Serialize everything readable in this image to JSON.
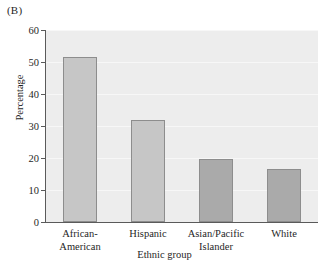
{
  "figure": {
    "panel_label": "(B)",
    "background_color": "#ffffff",
    "plot_background_color": "#ededed",
    "gridline_color": "#f7f7f7",
    "axis_color": "#5a5a5a",
    "text_color": "#1f1f1f"
  },
  "chart_data": {
    "type": "bar",
    "title": "",
    "subtitle": "",
    "panel_label": "(B)",
    "categories": [
      "African-\nAmerican",
      "Hispanic",
      "Asian/Pacific\nIslander",
      "White"
    ],
    "categories_flat": [
      "African-American",
      "Hispanic",
      "Asian/Pacific Islander",
      "White"
    ],
    "values": [
      51.7,
      32.0,
      19.6,
      16.5
    ],
    "bar_colors": [
      "#c6c6c6",
      "#c6c6c6",
      "#aaaaaa",
      "#aaaaaa"
    ],
    "bar_edge_color": "#8d8d8d",
    "xlabel": "Ethnic group",
    "ylabel": "Percentage",
    "ylim": [
      0,
      60
    ],
    "yticks": [
      0,
      10,
      20,
      30,
      40,
      50,
      60
    ],
    "ytick_labels": [
      "0",
      "10",
      "20",
      "30",
      "40",
      "50",
      "60"
    ],
    "grid": true,
    "grid_axis": "y",
    "legend": null,
    "legend_position": "none",
    "annotations": []
  }
}
